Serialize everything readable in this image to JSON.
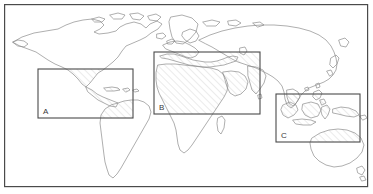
{
  "figure": {
    "type": "world-map-with-regions",
    "width": 373,
    "height": 194,
    "background_color": "#ffffff",
    "frame": {
      "name": "outer-frame",
      "x": 4,
      "y": 4,
      "width": 364,
      "height": 183,
      "stroke_color": "#4a4a4a",
      "stroke_width": 1.2,
      "fill": "#ffffff"
    },
    "coastline": {
      "stroke_color": "#8c8c8c",
      "stroke_width": 0.7,
      "fill": "none"
    },
    "hatch": {
      "pattern": "diagonal-lines",
      "direction": "lower-left-to-upper-right",
      "spacing_px": 5,
      "stroke_color": "#b9b9b9",
      "stroke_width": 0.6
    }
  },
  "regions": [
    {
      "id": "A",
      "label": "A",
      "name": "region-box-a",
      "description": "Latin America and the Caribbean",
      "x": 38,
      "y": 69,
      "width": 95,
      "height": 49,
      "label_x": 43,
      "label_y": 114,
      "stroke_color": "#4a4a4a",
      "stroke_width": 1.1
    },
    {
      "id": "B",
      "label": "B",
      "name": "region-box-b",
      "description": "Africa, Mediterranean and Middle East",
      "x": 154,
      "y": 52,
      "width": 106,
      "height": 62,
      "label_x": 159,
      "label_y": 110,
      "stroke_color": "#4a4a4a",
      "stroke_width": 1.1
    },
    {
      "id": "C",
      "label": "C",
      "name": "region-box-c",
      "description": "Southeast Asia and Oceania",
      "x": 276,
      "y": 94,
      "width": 84,
      "height": 48,
      "label_x": 281,
      "label_y": 138,
      "stroke_color": "#4a4a4a",
      "stroke_width": 1.1
    }
  ],
  "continents": [
    {
      "name": "north-america",
      "label": "North America"
    },
    {
      "name": "south-america",
      "label": "South America"
    },
    {
      "name": "europe",
      "label": "Europe"
    },
    {
      "name": "africa",
      "label": "Africa"
    },
    {
      "name": "asia",
      "label": "Asia"
    },
    {
      "name": "australia",
      "label": "Australia"
    },
    {
      "name": "greenland",
      "label": "Greenland"
    }
  ]
}
